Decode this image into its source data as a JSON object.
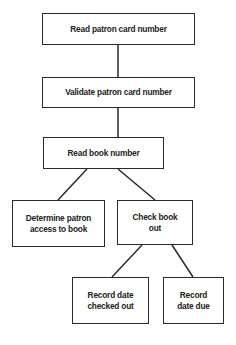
{
  "diagram": {
    "type": "hierarchy-flowchart",
    "nodes": [
      {
        "id": "read-patron-card",
        "label": "Read patron card number"
      },
      {
        "id": "validate-patron-card",
        "label": "Validate patron card number"
      },
      {
        "id": "read-book-number",
        "label": "Read book number"
      },
      {
        "id": "determine-access",
        "label": "Determine patron\naccess to book"
      },
      {
        "id": "check-book-out",
        "label": "Check book\nout"
      },
      {
        "id": "record-date-checked-out",
        "label": "Record date\nchecked out"
      },
      {
        "id": "record-date-due",
        "label": "Record\ndate due"
      }
    ],
    "edges": [
      {
        "from": "read-patron-card",
        "to": "validate-patron-card"
      },
      {
        "from": "validate-patron-card",
        "to": "read-book-number"
      },
      {
        "from": "read-book-number",
        "to": "determine-access"
      },
      {
        "from": "read-book-number",
        "to": "check-book-out"
      },
      {
        "from": "check-book-out",
        "to": "record-date-checked-out"
      },
      {
        "from": "check-book-out",
        "to": "record-date-due"
      }
    ]
  }
}
